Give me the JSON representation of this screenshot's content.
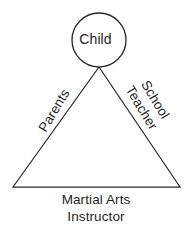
{
  "diagram": {
    "background_color": "#ffffff",
    "stroke_color": "#2b2b2b",
    "text_color": "#1f1f1f",
    "shapes": {
      "circle": {
        "name": "child-circle",
        "cx": 99,
        "cy": 40,
        "r": 27
      },
      "triangle": {
        "name": "support-triangle",
        "apex": {
          "x": 99,
          "y": 67
        },
        "bottom_left": {
          "x": 13,
          "y": 187
        },
        "bottom_right": {
          "x": 180,
          "y": 187
        }
      }
    },
    "nodes": {
      "child": {
        "label": "Child"
      },
      "parents": {
        "label": "Parents"
      },
      "school_teacher": {
        "line1": "School",
        "line2": "Teacher"
      },
      "martial_arts_instructor": {
        "line1": "Martial Arts",
        "line2": "Instructor"
      }
    }
  }
}
